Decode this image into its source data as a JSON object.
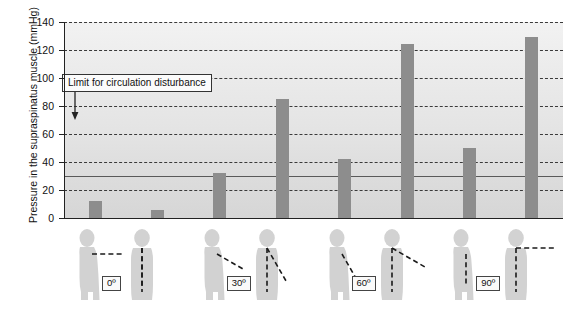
{
  "chart_data": {
    "type": "bar",
    "title": "",
    "xlabel": "",
    "ylabel": "Pressure in the supraspinatus muscle (mmHg)",
    "ylim": [
      0,
      140
    ],
    "yticks": [
      0,
      20,
      40,
      60,
      80,
      100,
      120,
      140
    ],
    "grid": true,
    "legend": "none",
    "categories": [
      "0º a",
      "0º b",
      "30º a",
      "30º b",
      "60º a",
      "60º b",
      "90º a",
      "90º b"
    ],
    "values": [
      12,
      6,
      32,
      85,
      42,
      124,
      50,
      129
    ],
    "bar_color": "#8d8d8d",
    "annotations": [
      {
        "text": "Limit for circulation disturbance",
        "value": 30,
        "line_style": "solid",
        "arrow": "down"
      }
    ],
    "group_labels": [
      "0º",
      "30º",
      "60º",
      "90º"
    ]
  },
  "axis": {
    "y_title": "Pressure in the supraspinatus muscle (mmHg)",
    "tick_labels": [
      "140",
      "120",
      "100",
      "80",
      "60",
      "40",
      "20",
      "0"
    ]
  },
  "annotation": {
    "limit_text": "Limit for circulation disturbance"
  },
  "pictograms": {
    "groups": [
      {
        "label": "0º",
        "side_angle_deg": 0,
        "front_angle_deg": 0
      },
      {
        "label": "30º",
        "side_angle_deg": 30,
        "front_angle_deg": 30
      },
      {
        "label": "60º",
        "side_angle_deg": 60,
        "front_angle_deg": 60
      },
      {
        "label": "90º",
        "side_angle_deg": 90,
        "front_angle_deg": 90
      }
    ]
  }
}
